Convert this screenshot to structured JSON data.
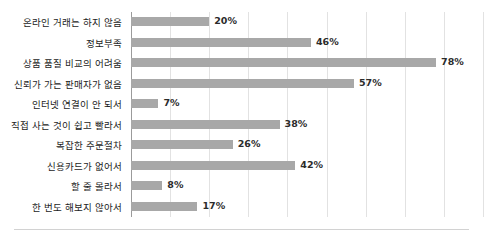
{
  "chart_data": {
    "type": "bar",
    "orientation": "horizontal",
    "title": "",
    "subtitle": "",
    "xlabel": "",
    "ylabel": "",
    "xlim": [
      0,
      90
    ],
    "grid": true,
    "legend": false,
    "gridline_values": [
      0,
      10,
      20,
      30,
      40,
      50,
      60,
      70,
      80,
      90
    ],
    "categories": [
      "온라인 거래는 하지 않음",
      "정보부족",
      "상품 품질 비교의 어려움",
      "신뢰가 가는 판매자가 없음",
      "인터넷 연결이 안 되서",
      "직접 사는 것이 쉽고 빨라서",
      "복잡한 주문절차",
      "신용카드가 없어서",
      "할 줄 몰라서",
      "한 번도 해보지 않아서"
    ],
    "values": [
      20,
      46,
      78,
      57,
      7,
      38,
      26,
      42,
      8,
      17
    ],
    "value_labels": [
      "20%",
      "46%",
      "78%",
      "57%",
      "7%",
      "38%",
      "26%",
      "42%",
      "8%",
      "17%"
    ],
    "colors": {
      "bar": "#a8a8a8",
      "gridline": "#e2e2e2",
      "axis": "#9b9b9b",
      "label_text": "#1c1c1c",
      "value_text": "#2b2b2b",
      "background": "#ffffff",
      "bottom_rule": "#d2d2d2"
    }
  }
}
